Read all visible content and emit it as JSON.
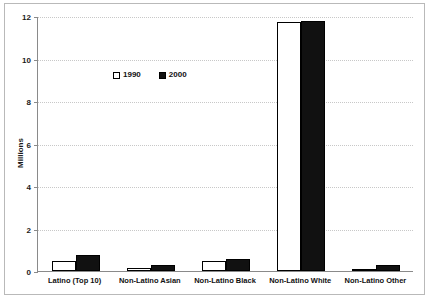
{
  "chart_data": {
    "type": "bar",
    "title": "",
    "xlabel": "",
    "ylabel": "Millions",
    "ylim": [
      0,
      12
    ],
    "ytick_step": 2,
    "yticks": [
      12,
      10,
      8,
      6,
      4,
      2,
      0
    ],
    "grid": true,
    "legend_position": "inside-upper-center",
    "categories": [
      "Latino (Top 10)",
      "Non-Latino Asian",
      "Non-Latino Black",
      "Non-Latino White",
      "Non-Latino Other"
    ],
    "series": [
      {
        "name": "1990",
        "color": "#ffffff",
        "values": [
          0.45,
          0.15,
          0.45,
          11.7,
          0.07
        ]
      },
      {
        "name": "2000",
        "color": "#111111",
        "values": [
          0.75,
          0.3,
          0.55,
          11.75,
          0.3
        ]
      }
    ]
  },
  "legend": {
    "items": [
      {
        "label": "1990",
        "swatch": "open-square-marker"
      },
      {
        "label": "2000",
        "swatch": "filled-square-marker"
      }
    ]
  },
  "axes": {
    "y_title": "Millions",
    "y_tick_labels": [
      "12",
      "10",
      "8",
      "6",
      "4",
      "2",
      "0"
    ]
  },
  "colors": {
    "series_1990": "#ffffff",
    "series_2000": "#111111",
    "axis": "#8a8a8a",
    "grid": "#c8c8c8",
    "frame": "#b9b9b9",
    "text": "#111111",
    "background": "#ffffff"
  }
}
